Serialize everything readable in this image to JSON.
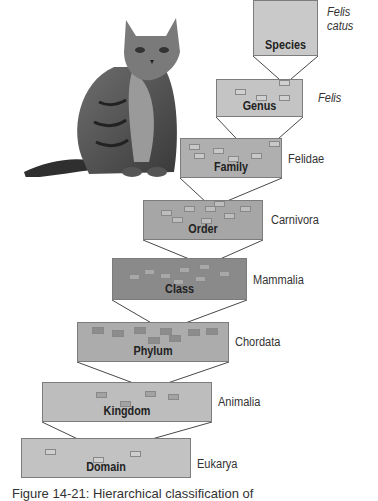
{
  "figure": {
    "caption": "Figure 14-21: Hierarchical classification of"
  },
  "image": {
    "subject": "Tabby cat sitting",
    "icon": "cat-photo-icon"
  },
  "colors": {
    "species": "#c9c9c9",
    "genus": "#c4c4c4",
    "family": "#afafaf",
    "order": "#a6a6a6",
    "class": "#8a8a8a",
    "phylum": "#acacac",
    "kingdom": "#bdbdbd",
    "domain": "#c2c2c2",
    "connector": "#333333"
  },
  "levels": [
    {
      "rank": "Species",
      "taxon": "Felis catus",
      "taxon_line1": "Felis",
      "taxon_line2": "catus",
      "italic": true
    },
    {
      "rank": "Genus",
      "taxon": "Felis",
      "italic": true
    },
    {
      "rank": "Family",
      "taxon": "Felidae",
      "italic": false
    },
    {
      "rank": "Order",
      "taxon": "Carnivora",
      "italic": false
    },
    {
      "rank": "Class",
      "taxon": "Mammalia",
      "italic": false
    },
    {
      "rank": "Phylum",
      "taxon": "Chordata",
      "italic": false
    },
    {
      "rank": "Kingdom",
      "taxon": "Animalia",
      "italic": false
    },
    {
      "rank": "Domain",
      "taxon": "Eukarya",
      "italic": false
    }
  ]
}
